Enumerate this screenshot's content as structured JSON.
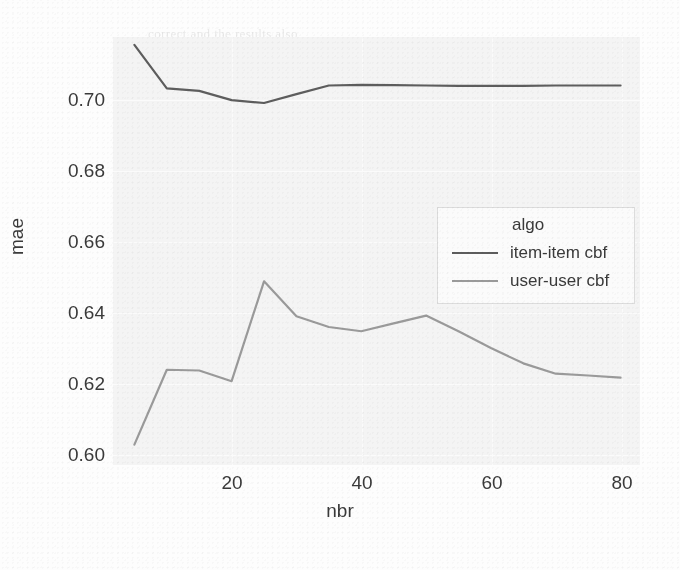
{
  "chart_data": {
    "type": "line",
    "title": "",
    "xlabel": "nbr",
    "ylabel": "mae",
    "xlim": [
      1.7,
      83
    ],
    "ylim": [
      0.5955,
      0.7155
    ],
    "xticks": [
      20,
      40,
      60,
      80
    ],
    "xticklabels": [
      "20",
      "40",
      "60",
      "80"
    ],
    "yticks": [
      0.6,
      0.62,
      0.64,
      0.66,
      0.68,
      0.7
    ],
    "yticklabels": [
      "0.60",
      "0.62",
      "0.64",
      "0.66",
      "0.68",
      "0.70"
    ],
    "grid": true,
    "legend_position": "center right",
    "legend_title": "algo",
    "x": [
      5,
      10,
      15,
      20,
      25,
      30,
      35,
      40,
      45,
      50,
      55,
      60,
      65,
      70,
      75,
      80
    ],
    "series": [
      {
        "name": "item-item cbf",
        "color": "#5d5d5d",
        "values": [
          0.7133,
          0.7011,
          0.7004,
          0.6978,
          0.697,
          0.6995,
          0.7019,
          0.7021,
          0.702,
          0.7019,
          0.7018,
          0.7018,
          0.7018,
          0.7019,
          0.7019,
          0.7019
        ]
      },
      {
        "name": "user-user cbf",
        "color": "#9a9a9a",
        "values": [
          0.6012,
          0.6222,
          0.622,
          0.619,
          0.647,
          0.6372,
          0.6342,
          0.633,
          0.6352,
          0.6374,
          0.633,
          0.6283,
          0.624,
          0.6211,
          0.6206,
          0.62
        ]
      }
    ]
  },
  "legend": {
    "title": "algo",
    "entries": [
      {
        "label": "item-item cbf",
        "color": "#5d5d5d"
      },
      {
        "label": "user-user cbf",
        "color": "#9a9a9a"
      }
    ]
  },
  "axes": {
    "ylabel": "mae",
    "xlabel": "nbr",
    "yticklabels": [
      "0.70",
      "0.68",
      "0.66",
      "0.64",
      "0.62",
      "0.60"
    ],
    "xticklabels": [
      "20",
      "40",
      "60",
      "80"
    ]
  },
  "background_text": {
    "lines": [
      "correct and the results also",
      "matrix, and the top-k of the",
      "general evaluation",
      "on the recommendation result form",
      "RMSE and MAE",
      "on both the obtained ... we had the result",
      "test set. With that result showed, the t r e",
      "result show and NDCG are the better. Above the",
      "of MSE or MAE will be measured by it as the"
    ],
    "heading1": "GENERAL EVALUATION",
    "heading2": "RMSE and MAE"
  }
}
